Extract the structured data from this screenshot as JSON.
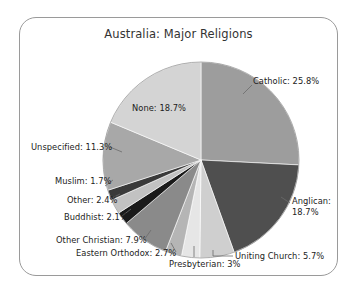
{
  "frame": {
    "border_color": "#9a9a9a",
    "background": "#ffffff"
  },
  "chart_data": {
    "type": "pie",
    "title": "Australia: Major Religions",
    "xlabel": "",
    "ylabel": "",
    "legend_position": "none",
    "labels_on_slices": true,
    "start_angle_deg": 0,
    "direction": "clockwise",
    "categories": [
      "Catholic",
      "Anglican",
      "Uniting Church",
      "Presbyterian",
      "Eastern Orthodox",
      "Other Christian",
      "Buddhist",
      "Other",
      "Muslim",
      "Unspecified",
      "None"
    ],
    "values": [
      25.8,
      18.7,
      5.7,
      3.0,
      2.7,
      7.9,
      2.1,
      2.4,
      1.7,
      11.3,
      18.7
    ],
    "unit": "%",
    "slices": [
      {
        "label": "Catholic",
        "value": 25.8,
        "text": "Catholic: 25.8%",
        "color": "#9d9d9d"
      },
      {
        "label": "Anglican",
        "value": 18.7,
        "text": "Anglican: 18.7%",
        "color": "#4f4f4f"
      },
      {
        "label": "Uniting Church",
        "value": 5.7,
        "text": "Uniting Church: 5.7%",
        "color": "#cfcfcf"
      },
      {
        "label": "Presbyterian",
        "value": 3.0,
        "text": "Presbyterian: 3%",
        "color": "#e6e6e6"
      },
      {
        "label": "Eastern Orthodox",
        "value": 2.7,
        "text": "Eastern Orthodox: 2.7%",
        "color": "#b5b5b5"
      },
      {
        "label": "Other Christian",
        "value": 7.9,
        "text": "Other Christian: 7.9%",
        "color": "#8a8a8a"
      },
      {
        "label": "Buddhist",
        "value": 2.1,
        "text": "Buddhist: 2.1%",
        "color": "#1a1a1a"
      },
      {
        "label": "Other",
        "value": 2.4,
        "text": "Other: 2.4%",
        "color": "#c2c2c2"
      },
      {
        "label": "Muslim",
        "value": 1.7,
        "text": "Muslim: 1.7%",
        "color": "#3a3a3a"
      },
      {
        "label": "Unspecified",
        "value": 11.3,
        "text": "Unspecified: 11.3%",
        "color": "#a8a8a8"
      },
      {
        "label": "None",
        "value": 18.7,
        "text": "None: 18.7%",
        "color": "#d4d4d4"
      }
    ]
  },
  "labels": {
    "catholic": "Catholic: 25.8%",
    "anglican_line1": "Anglican:",
    "anglican_line2": "18.7%",
    "uniting_church": "Uniting Church: 5.7%",
    "presbyterian": "Presbyterian: 3%",
    "eastern_orthodox": "Eastern Orthodox: 2.7%",
    "other_christian": "Other Christian: 7.9%",
    "buddhist": "Buddhist: 2.1%",
    "other": "Other: 2.4%",
    "muslim": "Muslim: 1.7%",
    "unspecified": "Unspecified: 11.3%",
    "none": "None: 18.7%"
  }
}
